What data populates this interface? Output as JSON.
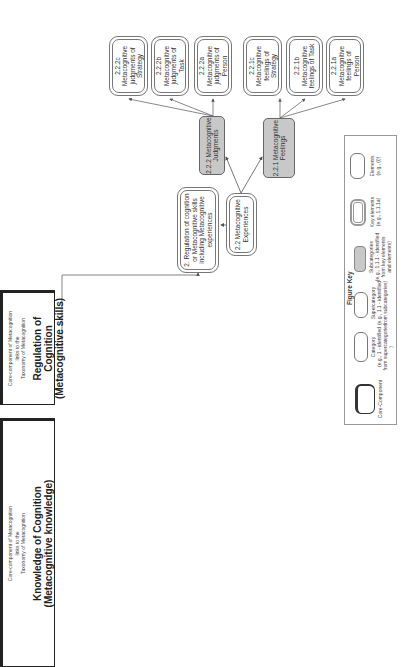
{
  "core_components": [
    {
      "id": "knowledge",
      "caption_lines": [
        "Core-component of Metacognition",
        "links to the",
        "Taxonomy of Metacognition"
      ],
      "title": "Knowledge of Cognition",
      "subtitle": "(Metacognitive knowledge)"
    },
    {
      "id": "regulation",
      "caption_lines": [
        "Core-component of Metacognition",
        "links to the",
        "Taxonomy of Metacognition"
      ],
      "title": "Regulation of Cognition",
      "subtitle": "(Metacognitive skills)"
    }
  ],
  "category": {
    "label": "2.  Regulation of cognition or Metacognitive skills including Metacognitive experiences"
  },
  "supercategory": {
    "label": "2.2 Metacognitive Experiences"
  },
  "subcategories": [
    {
      "id": "2.2.2",
      "label": "2.2.2 Metacognitive Judgments"
    },
    {
      "id": "2.2.1",
      "label": "2.2.1 Metacognitive Feelings"
    }
  ],
  "elements": [
    {
      "code": "2.2.2c",
      "label": "Metacognitive judgments of Strategy"
    },
    {
      "code": "2.2.2b",
      "label": "Metacognitive judgments of Task"
    },
    {
      "code": "2.2.2a",
      "label": "Metacognitive judgments of Person"
    },
    {
      "code": "2.2.1c",
      "label": "Metacognitive feelings of Strategy"
    },
    {
      "code": "2.2.1b",
      "label": "Metacognitive feelings of Task"
    },
    {
      "code": "2.2.1a",
      "label": "Metacognitive feelings of Person"
    }
  ],
  "figure_key": {
    "title": "Figure Key",
    "items": [
      {
        "name": "Core-Component",
        "desc": ""
      },
      {
        "name": "Category",
        "desc": "(e.g., 1 - identified from supercategories )"
      },
      {
        "name": "Supercategory",
        "desc": "(e.g., 1.1 - identified from subcategories)"
      },
      {
        "name": "Subcategories",
        "desc": "(e.g., 1.1.1 - identified from key elements and elements)"
      },
      {
        "name": "Key elements",
        "desc": "(e.g., 1.1.1a)"
      },
      {
        "name": "Elements",
        "desc": "(e.g., (i))"
      }
    ]
  },
  "colors": {
    "subcategory_fill": "#c8c8c8",
    "line": "#555555",
    "core_border": "#222222"
  }
}
